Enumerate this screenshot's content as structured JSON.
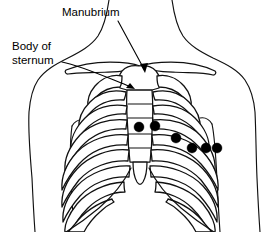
{
  "figure": {
    "title": "Anterior chest wall with sternum and rib cage, showing ECG electrode positions",
    "background_color": "#ffffff",
    "line_color": "#111111",
    "electrode_color": "#000000",
    "width": 277,
    "height": 232
  },
  "labels": [
    {
      "id": "manubrium",
      "text": "Manubrium",
      "x": 62,
      "y": 16,
      "leader_from": [
        118,
        20
      ],
      "leader_to": [
        145,
        72
      ],
      "arrow_at": [
        145,
        72
      ]
    },
    {
      "id": "body-of-sternum",
      "line1": "Body of",
      "line2": "sternum",
      "x": 12,
      "y1": 50,
      "y2": 64,
      "leader_from": [
        62,
        62
      ],
      "leader_to": [
        133,
        88
      ],
      "arrow_at": [
        133,
        88
      ]
    }
  ],
  "electrodes": [
    {
      "id": "v1",
      "cx": 139,
      "cy": 127,
      "r": 5.0
    },
    {
      "id": "v2",
      "cx": 155,
      "cy": 126,
      "r": 5.0
    },
    {
      "id": "v3",
      "cx": 176,
      "cy": 138,
      "r": 5.0
    },
    {
      "id": "v4",
      "cx": 192,
      "cy": 148,
      "r": 5.0
    },
    {
      "id": "v5",
      "cx": 206,
      "cy": 148,
      "r": 5.0
    },
    {
      "id": "v6",
      "cx": 217,
      "cy": 148,
      "r": 5.0
    }
  ],
  "anatomy": {
    "neck_left": "Left side of neck outline",
    "neck_right": "Right side of neck outline",
    "shoulder_left": "Left shoulder and upper arm outline",
    "shoulder_right": "Right shoulder and upper arm outline",
    "clavicle_left": "Left clavicle",
    "clavicle_right": "Right clavicle",
    "manubrium_bone": "Manubrium of sternum",
    "sternum_body": "Body of sternum",
    "xiphoid": "Xiphoid process",
    "ribs_left_count": 9,
    "ribs_right_count": 9
  }
}
